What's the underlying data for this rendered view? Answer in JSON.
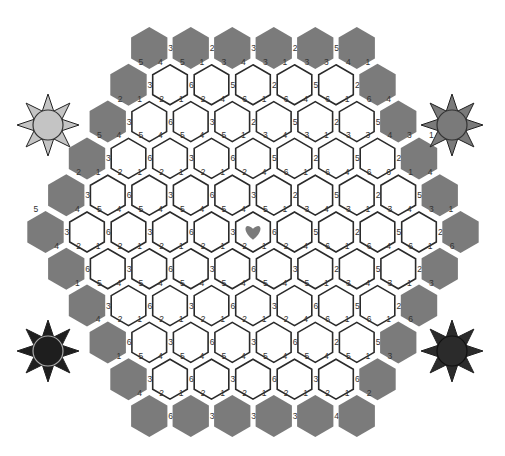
{
  "game": {
    "title": "Hex number puzzle board",
    "colors": {
      "cell_border": "#2a2a2a",
      "cell_fill": "#ffffff",
      "border_cell": "#7b7b7b",
      "heart": "#7b7b7b",
      "label": "#333333"
    },
    "geometry": {
      "center_x": 253,
      "row0_y": 48,
      "row_pitch": 36.8,
      "col_pitch": 41.5,
      "white_radius": 20,
      "gray_radius": 21
    },
    "rows": [
      {
        "cells": [
          "g",
          "g",
          "g",
          "g",
          "g",
          "g"
        ],
        "labels": [
          [
            null,
            null,
            "3"
          ],
          [
            null,
            null,
            "2"
          ],
          [
            null,
            null,
            "3"
          ],
          [
            null,
            null,
            "2"
          ],
          [
            null,
            null,
            "5"
          ],
          [
            null,
            null,
            null
          ]
        ]
      },
      {
        "cells": [
          "g",
          "w",
          "w",
          "w",
          "w",
          "w",
          "g"
        ],
        "labels": [
          [
            null,
            "5",
            "3"
          ],
          [
            "4",
            "5",
            "6"
          ],
          [
            "1",
            "3",
            "5"
          ],
          [
            "4",
            "3",
            "2"
          ],
          [
            "1",
            "3",
            "5"
          ],
          [
            "3",
            "4",
            "2"
          ],
          [
            "1",
            null,
            null
          ]
        ]
      },
      {
        "cells": [
          "g",
          "w",
          "w",
          "w",
          "w",
          "w",
          "w",
          "g"
        ],
        "labels": [
          [
            null,
            "2",
            "3"
          ],
          [
            "1",
            "2",
            "6"
          ],
          [
            "1",
            "2",
            "3"
          ],
          [
            "4",
            "6",
            "2"
          ],
          [
            "1",
            "6",
            "5"
          ],
          [
            "4",
            "6",
            "2"
          ],
          [
            "1",
            "6",
            "5"
          ],
          [
            "4",
            null,
            null
          ]
        ]
      },
      {
        "cells": [
          "g",
          "w",
          "w",
          "w",
          "w",
          "w",
          "w",
          "w",
          "g"
        ],
        "labels": [
          [
            null,
            "5",
            "3"
          ],
          [
            "4",
            "5",
            "6"
          ],
          [
            "4",
            "5",
            "3"
          ],
          [
            "4",
            "5",
            "6"
          ],
          [
            "1",
            "3",
            "5"
          ],
          [
            "4",
            "3",
            "2"
          ],
          [
            "1",
            "3",
            "5"
          ],
          [
            "3",
            "4",
            "2"
          ],
          [
            "3",
            "1",
            null
          ]
        ]
      },
      {
        "cells": [
          "g",
          "w",
          "w",
          "w",
          "w",
          "w",
          "w",
          "w",
          "w",
          "g"
        ],
        "labels": [
          [
            null,
            "2",
            "3"
          ],
          [
            "1",
            "2",
            "6"
          ],
          [
            "1",
            "2",
            "3"
          ],
          [
            "1",
            "2",
            "6"
          ],
          [
            "1",
            "2",
            "3"
          ],
          [
            "4",
            "6",
            "2"
          ],
          [
            "1",
            "6",
            "5"
          ],
          [
            "4",
            "6",
            "2"
          ],
          [
            "6",
            "1",
            "5"
          ],
          [
            "4",
            null,
            null
          ]
        ]
      },
      {
        "cells": [
          "g",
          "w",
          "w",
          "w",
          "w",
          "h",
          "w",
          "w",
          "w",
          "w",
          "g"
        ],
        "labels": [
          [
            "5",
            null,
            "3"
          ],
          [
            "4",
            "5",
            "6"
          ],
          [
            "4",
            "5",
            "3"
          ],
          [
            "4",
            "5",
            "6"
          ],
          [
            "4",
            "5",
            "3"
          ],
          [
            "4",
            "5",
            "6"
          ],
          [
            "1",
            "3",
            "5"
          ],
          [
            "4",
            "3",
            "2"
          ],
          [
            "1",
            "3",
            "5"
          ],
          [
            "4",
            "3",
            "2"
          ],
          [
            "1",
            null,
            null
          ]
        ]
      },
      {
        "cells": [
          "g",
          "w",
          "w",
          "w",
          "w",
          "w",
          "w",
          "w",
          "w",
          "g"
        ],
        "labels": [
          [
            "4",
            "2",
            "6"
          ],
          [
            "1",
            "2",
            "3"
          ],
          [
            "1",
            "2",
            "6"
          ],
          [
            "1",
            "2",
            "3"
          ],
          [
            "1",
            "2",
            "6"
          ],
          [
            "1",
            "2",
            "3"
          ],
          [
            "4",
            "6",
            "2"
          ],
          [
            "1",
            "6",
            "5"
          ],
          [
            "4",
            "6",
            "2"
          ],
          [
            "1",
            "6",
            null
          ]
        ]
      },
      {
        "cells": [
          "g",
          "w",
          "w",
          "w",
          "w",
          "w",
          "w",
          "w",
          "g"
        ],
        "labels": [
          [
            "1",
            "5",
            "3"
          ],
          [
            "4",
            "5",
            "6"
          ],
          [
            "4",
            "5",
            "3"
          ],
          [
            "4",
            "5",
            "6"
          ],
          [
            "4",
            "5",
            "3"
          ],
          [
            "4",
            "5",
            "6"
          ],
          [
            "1",
            "3",
            "5"
          ],
          [
            "4",
            "3",
            "2"
          ],
          [
            "1",
            "3",
            null
          ]
        ]
      },
      {
        "cells": [
          "g",
          "w",
          "w",
          "w",
          "w",
          "w",
          "w",
          "g"
        ],
        "labels": [
          [
            "4",
            "2",
            "6"
          ],
          [
            "1",
            "2",
            "3"
          ],
          [
            "1",
            "2",
            "6"
          ],
          [
            "1",
            "2",
            "3"
          ],
          [
            "1",
            "2",
            "6"
          ],
          [
            "4",
            "6",
            "2"
          ],
          [
            "1",
            "6",
            "5"
          ],
          [
            "1",
            "6",
            null
          ]
        ]
      },
      {
        "cells": [
          "g",
          "w",
          "w",
          "w",
          "w",
          "w",
          "g"
        ],
        "labels": [
          [
            "1",
            "5",
            "3"
          ],
          [
            "4",
            "5",
            "6"
          ],
          [
            "4",
            "5",
            "3"
          ],
          [
            "4",
            "5",
            "6"
          ],
          [
            "4",
            "5",
            "3"
          ],
          [
            "4",
            "5",
            "6"
          ],
          [
            "1",
            "3",
            null
          ]
        ]
      },
      {
        "cells": [
          "g",
          "g",
          "g",
          "g",
          "g",
          "g"
        ],
        "labels": [
          [
            "4",
            "2",
            "6"
          ],
          [
            "1",
            "2",
            "3"
          ],
          [
            "1",
            "2",
            "3"
          ],
          [
            "1",
            "2",
            "3"
          ],
          [
            "1",
            "2",
            "4"
          ],
          [
            "1",
            "2",
            null
          ]
        ]
      }
    ],
    "corner_suns": [
      {
        "name": "sun-light-top-left",
        "x": 15,
        "y": 92,
        "fill": "#c4c4c4",
        "stroke": "#333333"
      },
      {
        "name": "sun-mid-top-right",
        "x": 419,
        "y": 92,
        "fill": "#7a7a7a",
        "stroke": "#333333"
      },
      {
        "name": "sun-dark-bottom-left",
        "x": 15,
        "y": 318,
        "fill": "#1e1e1e",
        "stroke": "#aaaaaa"
      },
      {
        "name": "sun-dark-bottom-right",
        "x": 419,
        "y": 318,
        "fill": "#2b2b2b",
        "stroke": "#111111"
      }
    ]
  }
}
